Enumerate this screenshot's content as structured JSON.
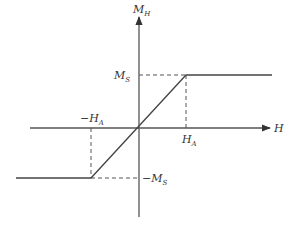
{
  "diagram": {
    "type": "magnetization-curve",
    "axes": {
      "x_label": "H",
      "y_label": "M",
      "y_label_sub": "H"
    },
    "labels": {
      "ms": {
        "main": "M",
        "sub": "S"
      },
      "neg_ms": {
        "prefix": "−",
        "main": "M",
        "sub": "S"
      },
      "ha": {
        "main": "H",
        "sub": "A"
      },
      "neg_ha": {
        "prefix": "−",
        "main": "H",
        "sub": "A"
      }
    },
    "curve_points": [
      {
        "H": "-inf",
        "M": "-Ms"
      },
      {
        "H": "-Ha",
        "M": "-Ms"
      },
      {
        "H": "Ha",
        "M": "Ms"
      },
      {
        "H": "+inf",
        "M": "Ms"
      }
    ],
    "colors": {
      "line": "#444444",
      "axis": "#555555",
      "text": "#333333"
    }
  }
}
